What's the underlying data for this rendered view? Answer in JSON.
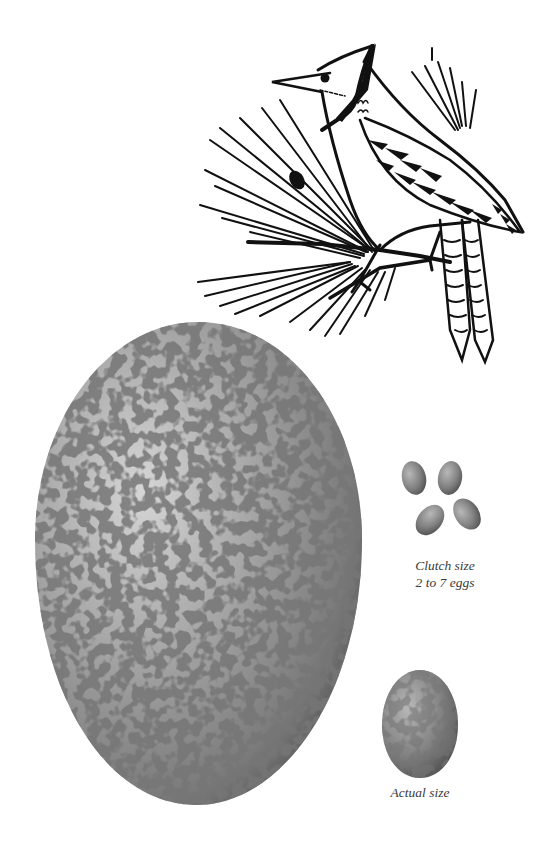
{
  "illustration": {
    "subject": "blue-jay-bird-on-pine-branch",
    "style": "black ink line drawing"
  },
  "large_egg": {
    "label": "enlarged-egg",
    "base_color": "#a8a8a8",
    "speckle_color": "#4a4a4a"
  },
  "clutch": {
    "egg_count_shown": 4,
    "caption_line1": "Clutch size",
    "caption_line2": "2 to 7 eggs"
  },
  "actual_egg": {
    "caption": "Actual size"
  },
  "colors": {
    "background": "#ffffff",
    "ink": "#111111",
    "caption_text": "#3a3a3a"
  }
}
